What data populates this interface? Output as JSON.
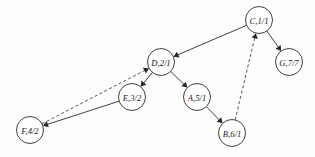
{
  "diagram": {
    "node_radius": 13.5,
    "colors": {
      "node_fill": "#ffffff",
      "node_stroke": "#2a2a2a",
      "edge_stroke": "#2a2a2a",
      "background": "#fdfdfc"
    },
    "nodes": [
      {
        "id": "C",
        "label": "C,1/1",
        "x": 259,
        "y": 20
      },
      {
        "id": "G",
        "label": "G,7/7",
        "x": 289,
        "y": 62
      },
      {
        "id": "D",
        "label": "D,2/1",
        "x": 161,
        "y": 62
      },
      {
        "id": "E",
        "label": "E,3/2",
        "x": 132,
        "y": 97
      },
      {
        "id": "A",
        "label": "A,5/1",
        "x": 197,
        "y": 97
      },
      {
        "id": "B",
        "label": "B,6/1",
        "x": 232,
        "y": 133
      },
      {
        "id": "F",
        "label": "F,4/2",
        "x": 30,
        "y": 130
      }
    ],
    "edges": [
      {
        "id": "C-D",
        "from": "C",
        "to": "D",
        "style": "solid",
        "arrow": "to"
      },
      {
        "id": "C-G",
        "from": "C",
        "to": "G",
        "style": "solid",
        "arrow": "to"
      },
      {
        "id": "D-E",
        "from": "D",
        "to": "E",
        "style": "solid",
        "arrow": "to"
      },
      {
        "id": "D-A",
        "from": "D",
        "to": "A",
        "style": "solid",
        "arrow": "to"
      },
      {
        "id": "A-B",
        "from": "A",
        "to": "B",
        "style": "solid",
        "arrow": "to"
      },
      {
        "id": "E-F",
        "from": "E",
        "to": "F",
        "style": "solid",
        "arrow": "to"
      },
      {
        "id": "F-D",
        "from": "F",
        "to": "D",
        "style": "dashed",
        "arrow": "to"
      },
      {
        "id": "B-C",
        "from": "B",
        "to": "C",
        "style": "dashed",
        "arrow": "to"
      }
    ]
  }
}
